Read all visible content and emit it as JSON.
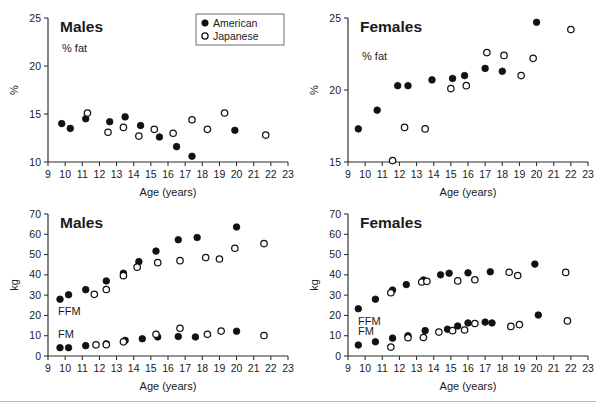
{
  "figure": {
    "legend": {
      "entries": [
        {
          "label": "American",
          "marker": "filled-circle"
        },
        {
          "label": "Japanese",
          "marker": "open-circle"
        }
      ]
    },
    "axis_titles": {
      "x": "Age (years)",
      "y_percent": "%",
      "y_kg": "kg"
    },
    "series_labels": {
      "ffm": "FFM",
      "fm": "FM",
      "pct_fat": "% fat"
    }
  },
  "chart_data": [
    {
      "id": "males-pct-fat",
      "type": "scatter",
      "title": "Males",
      "annotation": "% fat",
      "xlabel": "Age (years)",
      "ylabel": "%",
      "xlim": [
        9,
        23
      ],
      "ylim": [
        10,
        25
      ],
      "xticks": [
        9,
        10,
        11,
        12,
        13,
        14,
        15,
        16,
        17,
        18,
        19,
        20,
        21,
        22,
        23
      ],
      "yticks": [
        10,
        15,
        20,
        25
      ],
      "grid": false,
      "legend_position": "top-right",
      "series": [
        {
          "name": "American",
          "marker": "filled-circle",
          "points": [
            {
              "x": 9.8,
              "y": 14.0
            },
            {
              "x": 10.3,
              "y": 13.5
            },
            {
              "x": 11.2,
              "y": 14.5
            },
            {
              "x": 12.6,
              "y": 14.2
            },
            {
              "x": 13.5,
              "y": 14.7
            },
            {
              "x": 14.4,
              "y": 13.8
            },
            {
              "x": 15.5,
              "y": 12.6
            },
            {
              "x": 16.5,
              "y": 11.6
            },
            {
              "x": 17.4,
              "y": 10.6
            },
            {
              "x": 19.9,
              "y": 13.3
            }
          ]
        },
        {
          "name": "Japanese",
          "marker": "open-circle",
          "points": [
            {
              "x": 11.3,
              "y": 15.1
            },
            {
              "x": 12.5,
              "y": 13.1
            },
            {
              "x": 13.4,
              "y": 13.6
            },
            {
              "x": 14.3,
              "y": 12.7
            },
            {
              "x": 15.2,
              "y": 13.4
            },
            {
              "x": 16.3,
              "y": 13.0
            },
            {
              "x": 17.4,
              "y": 14.4
            },
            {
              "x": 18.3,
              "y": 13.4
            },
            {
              "x": 19.3,
              "y": 15.1
            },
            {
              "x": 21.7,
              "y": 12.8
            }
          ]
        }
      ]
    },
    {
      "id": "females-pct-fat",
      "type": "scatter",
      "title": "Females",
      "annotation": "% fat",
      "xlabel": "Age (years)",
      "ylabel": "%",
      "xlim": [
        9,
        23
      ],
      "ylim": [
        15,
        25
      ],
      "xticks": [
        9,
        10,
        11,
        12,
        13,
        14,
        15,
        16,
        17,
        18,
        19,
        20,
        21,
        22,
        23
      ],
      "yticks": [
        15,
        20,
        25
      ],
      "grid": false,
      "series": [
        {
          "name": "American",
          "marker": "filled-circle",
          "points": [
            {
              "x": 9.6,
              "y": 17.3
            },
            {
              "x": 10.7,
              "y": 18.6
            },
            {
              "x": 11.9,
              "y": 20.3
            },
            {
              "x": 12.5,
              "y": 20.3
            },
            {
              "x": 13.9,
              "y": 20.7
            },
            {
              "x": 15.1,
              "y": 20.8
            },
            {
              "x": 15.8,
              "y": 21.0
            },
            {
              "x": 17.0,
              "y": 21.5
            },
            {
              "x": 18.0,
              "y": 21.3
            },
            {
              "x": 20.0,
              "y": 24.7
            }
          ]
        },
        {
          "name": "Japanese",
          "marker": "open-circle",
          "points": [
            {
              "x": 11.6,
              "y": 15.1
            },
            {
              "x": 12.3,
              "y": 17.4
            },
            {
              "x": 13.5,
              "y": 17.3
            },
            {
              "x": 15.0,
              "y": 20.1
            },
            {
              "x": 15.9,
              "y": 20.3
            },
            {
              "x": 17.1,
              "y": 22.6
            },
            {
              "x": 18.1,
              "y": 22.4
            },
            {
              "x": 19.1,
              "y": 21.0
            },
            {
              "x": 19.8,
              "y": 22.2
            },
            {
              "x": 22.0,
              "y": 24.2
            }
          ]
        }
      ]
    },
    {
      "id": "males-body-composition",
      "type": "scatter",
      "title": "Males",
      "xlabel": "Age (years)",
      "ylabel": "kg",
      "xlim": [
        9,
        23
      ],
      "ylim": [
        0,
        70
      ],
      "xticks": [
        9,
        10,
        11,
        12,
        13,
        14,
        15,
        16,
        17,
        18,
        19,
        20,
        21,
        22,
        23
      ],
      "yticks": [
        0,
        10,
        20,
        30,
        40,
        50,
        60,
        70
      ],
      "grid": false,
      "series": [
        {
          "name": "American FFM",
          "group": "FFM",
          "marker": "filled-circle",
          "points": [
            {
              "x": 9.7,
              "y": 28.0
            },
            {
              "x": 10.2,
              "y": 30.2
            },
            {
              "x": 11.2,
              "y": 32.7
            },
            {
              "x": 12.4,
              "y": 37.0
            },
            {
              "x": 13.4,
              "y": 40.8
            },
            {
              "x": 14.3,
              "y": 46.5
            },
            {
              "x": 15.3,
              "y": 51.7
            },
            {
              "x": 16.6,
              "y": 57.3
            },
            {
              "x": 17.7,
              "y": 58.4
            },
            {
              "x": 20.0,
              "y": 63.6
            }
          ]
        },
        {
          "name": "Japanese FFM",
          "group": "FFM",
          "marker": "open-circle",
          "points": [
            {
              "x": 11.7,
              "y": 30.4
            },
            {
              "x": 12.4,
              "y": 32.8
            },
            {
              "x": 13.4,
              "y": 39.6
            },
            {
              "x": 14.2,
              "y": 43.8
            },
            {
              "x": 15.4,
              "y": 46.0
            },
            {
              "x": 16.7,
              "y": 47.0
            },
            {
              "x": 18.2,
              "y": 48.5
            },
            {
              "x": 19.0,
              "y": 47.8
            },
            {
              "x": 19.9,
              "y": 53.1
            },
            {
              "x": 21.6,
              "y": 55.4
            }
          ]
        },
        {
          "name": "American FM",
          "group": "FM",
          "marker": "filled-circle",
          "points": [
            {
              "x": 9.7,
              "y": 4.1
            },
            {
              "x": 10.2,
              "y": 4.1
            },
            {
              "x": 11.2,
              "y": 5.1
            },
            {
              "x": 12.4,
              "y": 6.0
            },
            {
              "x": 13.5,
              "y": 7.7
            },
            {
              "x": 14.5,
              "y": 8.5
            },
            {
              "x": 15.4,
              "y": 9.4
            },
            {
              "x": 16.6,
              "y": 9.6
            },
            {
              "x": 17.6,
              "y": 9.4
            },
            {
              "x": 20.0,
              "y": 12.2
            }
          ]
        },
        {
          "name": "Japanese FM",
          "group": "FM",
          "marker": "open-circle",
          "points": [
            {
              "x": 11.8,
              "y": 5.5
            },
            {
              "x": 12.4,
              "y": 5.6
            },
            {
              "x": 13.4,
              "y": 7.0
            },
            {
              "x": 15.3,
              "y": 10.7
            },
            {
              "x": 16.7,
              "y": 13.7
            },
            {
              "x": 18.3,
              "y": 10.7
            },
            {
              "x": 19.1,
              "y": 12.3
            },
            {
              "x": 21.6,
              "y": 10.1
            }
          ]
        }
      ]
    },
    {
      "id": "females-body-composition",
      "type": "scatter",
      "title": "Females",
      "xlabel": "Age (years)",
      "ylabel": "kg",
      "xlim": [
        9,
        23
      ],
      "ylim": [
        0,
        70
      ],
      "xticks": [
        9,
        10,
        11,
        12,
        13,
        14,
        15,
        16,
        17,
        18,
        19,
        20,
        21,
        22,
        23
      ],
      "yticks": [
        0,
        10,
        20,
        30,
        40,
        50,
        60,
        70
      ],
      "grid": false,
      "series": [
        {
          "name": "American FFM",
          "group": "FFM",
          "marker": "filled-circle",
          "points": [
            {
              "x": 9.6,
              "y": 23.3
            },
            {
              "x": 10.6,
              "y": 28.0
            },
            {
              "x": 11.6,
              "y": 32.5
            },
            {
              "x": 12.4,
              "y": 35.2
            },
            {
              "x": 13.4,
              "y": 37.5
            },
            {
              "x": 14.4,
              "y": 40.0
            },
            {
              "x": 14.9,
              "y": 40.8
            },
            {
              "x": 16.0,
              "y": 41.0
            },
            {
              "x": 17.3,
              "y": 41.5
            },
            {
              "x": 19.9,
              "y": 45.3
            }
          ]
        },
        {
          "name": "Japanese FFM",
          "group": "FFM",
          "marker": "open-circle",
          "points": [
            {
              "x": 11.5,
              "y": 31.2
            },
            {
              "x": 13.3,
              "y": 36.5
            },
            {
              "x": 13.6,
              "y": 36.8
            },
            {
              "x": 15.4,
              "y": 37.0
            },
            {
              "x": 16.4,
              "y": 37.6
            },
            {
              "x": 18.4,
              "y": 41.3
            },
            {
              "x": 18.9,
              "y": 39.7
            },
            {
              "x": 21.7,
              "y": 41.2
            }
          ]
        },
        {
          "name": "American FM",
          "group": "FM",
          "marker": "filled-circle",
          "points": [
            {
              "x": 9.6,
              "y": 5.4
            },
            {
              "x": 10.6,
              "y": 7.0
            },
            {
              "x": 11.6,
              "y": 8.8
            },
            {
              "x": 12.5,
              "y": 10.0
            },
            {
              "x": 13.5,
              "y": 12.5
            },
            {
              "x": 14.8,
              "y": 13.2
            },
            {
              "x": 15.4,
              "y": 14.8
            },
            {
              "x": 16.0,
              "y": 16.3
            },
            {
              "x": 17.0,
              "y": 16.7
            },
            {
              "x": 17.4,
              "y": 16.3
            },
            {
              "x": 20.1,
              "y": 20.2
            }
          ]
        },
        {
          "name": "Japanese FM",
          "group": "FM",
          "marker": "open-circle",
          "points": [
            {
              "x": 11.5,
              "y": 4.4
            },
            {
              "x": 12.5,
              "y": 9.0
            },
            {
              "x": 13.4,
              "y": 9.1
            },
            {
              "x": 14.3,
              "y": 11.8
            },
            {
              "x": 15.1,
              "y": 12.5
            },
            {
              "x": 15.8,
              "y": 12.8
            },
            {
              "x": 16.4,
              "y": 16.0
            },
            {
              "x": 18.5,
              "y": 14.6
            },
            {
              "x": 19.0,
              "y": 15.5
            },
            {
              "x": 21.8,
              "y": 17.3
            }
          ]
        }
      ]
    }
  ]
}
